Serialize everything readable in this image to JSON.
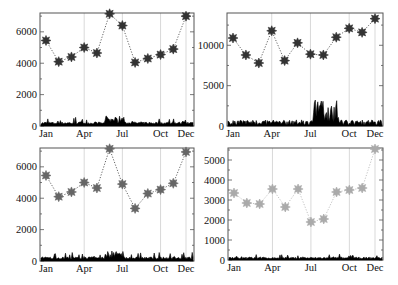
{
  "months": [
    "Jan",
    "Feb",
    "Mar",
    "Apr",
    "May",
    "Jun",
    "Jul",
    "Aug",
    "Sep",
    "Oct",
    "Nov",
    "Dec"
  ],
  "x_tick_labels": [
    "Jan",
    "Apr",
    "Jul",
    "Oct",
    "Dec"
  ],
  "colors": {
    "frame": "#555555",
    "grid": "#cfcfcf",
    "marker_dark": "#333333",
    "marker_mid": "#666666",
    "marker_light": "#aaaaaa",
    "daily": "#000000",
    "line_dark": "#555555",
    "line_light": "#bbbbbb"
  },
  "chart_data": [
    {
      "type": "line",
      "panel": "top-left",
      "title": "",
      "xlabel": "",
      "ylabel": "",
      "categories": [
        "Jan",
        "Feb",
        "Mar",
        "Apr",
        "May",
        "Jun",
        "Jul",
        "Aug",
        "Sep",
        "Oct",
        "Nov",
        "Dec"
      ],
      "x_ticks": [
        "Jan",
        "Apr",
        "Jul",
        "Oct",
        "Dec"
      ],
      "y_ticks": [
        0,
        2000,
        4000,
        6000
      ],
      "ylim": [
        0,
        7200
      ],
      "series": [
        {
          "name": "monthly",
          "style": "dotted line with star markers",
          "values": [
            5450,
            4100,
            4400,
            5000,
            4650,
            7150,
            6400,
            4050,
            4300,
            4550,
            4900,
            7000
          ]
        },
        {
          "name": "daily",
          "style": "filled spiky area near baseline",
          "approx_max": 650
        }
      ],
      "grid": "vertical lines at Apr, Jul, Oct, Dec",
      "marker_shade": "dark"
    },
    {
      "type": "line",
      "panel": "top-right",
      "title": "",
      "xlabel": "",
      "ylabel": "",
      "categories": [
        "Jan",
        "Feb",
        "Mar",
        "Apr",
        "May",
        "Jun",
        "Jul",
        "Aug",
        "Sep",
        "Oct",
        "Nov",
        "Dec"
      ],
      "x_ticks": [
        "Jan",
        "Apr",
        "Jul",
        "Oct",
        "Dec"
      ],
      "y_ticks": [
        0,
        5000,
        10000
      ],
      "ylim": [
        0,
        14000
      ],
      "series": [
        {
          "name": "monthly",
          "style": "dotted line with star markers",
          "values": [
            10900,
            8800,
            7800,
            11800,
            8100,
            10300,
            8900,
            8800,
            11000,
            12100,
            11600,
            13300
          ]
        },
        {
          "name": "daily",
          "style": "filled spiky area near baseline, peaks in Aug-Sep",
          "approx_max": 3300
        }
      ],
      "grid": "vertical lines at Apr, Jul, Oct, Dec",
      "marker_shade": "dark"
    },
    {
      "type": "line",
      "panel": "bottom-left",
      "title": "",
      "xlabel": "",
      "ylabel": "",
      "categories": [
        "Jan",
        "Feb",
        "Mar",
        "Apr",
        "May",
        "Jun",
        "Jul",
        "Aug",
        "Sep",
        "Oct",
        "Nov",
        "Dec"
      ],
      "x_ticks": [
        "Jan",
        "Apr",
        "Jul",
        "Oct",
        "Dec"
      ],
      "y_ticks": [
        0,
        2000,
        4000,
        6000
      ],
      "ylim": [
        0,
        7200
      ],
      "series": [
        {
          "name": "monthly",
          "style": "dotted line with star markers",
          "values": [
            5450,
            4100,
            4400,
            5000,
            4650,
            7150,
            4900,
            3350,
            4300,
            4550,
            4950,
            6950
          ]
        },
        {
          "name": "daily",
          "style": "filled spiky area near baseline",
          "approx_max": 650
        }
      ],
      "grid": "vertical lines at Apr, Jul, Oct, Dec",
      "marker_shade": "mid"
    },
    {
      "type": "line",
      "panel": "bottom-right",
      "title": "",
      "xlabel": "",
      "ylabel": "",
      "categories": [
        "Jan",
        "Feb",
        "Mar",
        "Apr",
        "May",
        "Jun",
        "Jul",
        "Aug",
        "Sep",
        "Oct",
        "Nov",
        "Dec"
      ],
      "x_ticks": [
        "Jan",
        "Apr",
        "Jul",
        "Oct",
        "Dec"
      ],
      "y_ticks": [
        0,
        1000,
        2000,
        3000,
        4000,
        5000
      ],
      "ylim": [
        0,
        5600
      ],
      "series": [
        {
          "name": "monthly",
          "style": "dotted line with star markers",
          "values": [
            3350,
            2850,
            2800,
            3550,
            2650,
            3550,
            1900,
            2050,
            3400,
            3500,
            3600,
            5550
          ]
        },
        {
          "name": "daily",
          "style": "filled spiky area near baseline",
          "approx_max": 350
        }
      ],
      "grid": "vertical lines at Apr, Jul, Oct, Dec",
      "marker_shade": "light"
    }
  ]
}
